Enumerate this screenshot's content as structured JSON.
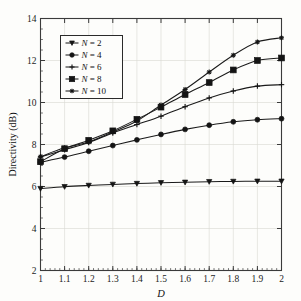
{
  "chart_data": {
    "type": "line",
    "title": "",
    "xlabel": "D",
    "ylabel": "Directivity (dB)",
    "xlim": [
      1,
      2
    ],
    "ylim": [
      2,
      14
    ],
    "xticks": [
      1,
      1.1,
      1.2,
      1.3,
      1.4,
      1.5,
      1.6,
      1.7,
      1.8,
      1.9,
      2
    ],
    "xtick_labels": [
      "1",
      "1.1",
      "1.2",
      "1.3",
      "1.4",
      "1.5",
      "1.6",
      "1.7",
      "1.8",
      "1.9",
      "2"
    ],
    "yticks": [
      2,
      4,
      6,
      8,
      10,
      12,
      14
    ],
    "ytick_labels": [
      "2",
      "4",
      "6",
      "8",
      "10",
      "12",
      "14"
    ],
    "x_minor_tick_step": 0.02,
    "y_minor_tick_step": 0.5,
    "grid": true,
    "grid_color": "#d8d8d2",
    "legend_position": "upper-left",
    "line_color": "#1a1a1a",
    "x": [
      1,
      1.1,
      1.2,
      1.3,
      1.4,
      1.5,
      1.6,
      1.7,
      1.8,
      1.9,
      2
    ],
    "series": [
      {
        "name": "N = 2",
        "label_prefix": "N",
        "label_value": "2",
        "marker": "triangle-down",
        "values": [
          5.9,
          5.99,
          6.05,
          6.1,
          6.14,
          6.18,
          6.2,
          6.23,
          6.24,
          6.25,
          6.25
        ]
      },
      {
        "name": "N = 4",
        "label_prefix": "N",
        "label_value": "4",
        "marker": "circle",
        "values": [
          7.15,
          7.4,
          7.68,
          7.95,
          8.22,
          8.48,
          8.72,
          8.92,
          9.08,
          9.18,
          9.23
        ]
      },
      {
        "name": "N = 6",
        "label_prefix": "N",
        "label_value": "6",
        "marker": "plus",
        "values": [
          7.4,
          7.75,
          8.1,
          8.55,
          8.95,
          9.35,
          9.8,
          10.22,
          10.55,
          10.78,
          10.85
        ]
      },
      {
        "name": "N = 8",
        "label_prefix": "N",
        "label_value": "8",
        "marker": "square",
        "values": [
          7.18,
          7.8,
          8.2,
          8.65,
          9.2,
          9.78,
          10.38,
          10.95,
          11.55,
          12.0,
          12.12
        ]
      },
      {
        "name": "N = 10",
        "label_prefix": "N",
        "label_value": "10",
        "marker": "cross",
        "values": [
          7.42,
          7.84,
          8.12,
          8.6,
          9.12,
          9.88,
          10.62,
          11.45,
          12.25,
          12.88,
          13.08
        ]
      }
    ]
  }
}
